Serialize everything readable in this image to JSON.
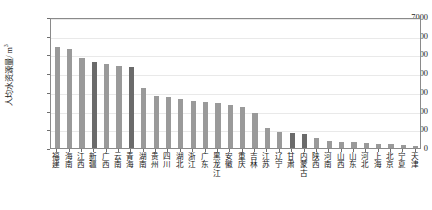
{
  "chart_data": {
    "type": "bar",
    "title": "",
    "subtitle": "",
    "xlabel": "",
    "ylabel": "人均水资源量/ m³",
    "ylabel_text": "人均水资源量/ m",
    "ylabel_exponent": "3",
    "ylim": [
      0,
      7000
    ],
    "ytick_values": [
      0,
      1000,
      2000,
      3000,
      4000,
      5000,
      6000,
      7000
    ],
    "ytick_labels": [
      "0",
      "1000",
      "2000",
      "3000",
      "4000",
      "5000",
      "6000",
      "7000"
    ],
    "grid": true,
    "grid_axis": "y",
    "legend": null,
    "legend_position": "none",
    "bar_color": "#9a9a9a",
    "bar_color_highlight": "#6b6b6b",
    "frame_color": "#8a8a8a",
    "gridline_color": "#e9e9e9",
    "categories": [
      "福建",
      "海南",
      "江西",
      "新疆",
      "广西",
      "云南",
      "青海",
      "湖南",
      "贵州",
      "四川",
      "湖北",
      "浙江",
      "广东",
      "黑龙江",
      "安徽",
      "重庆",
      "吉林",
      "江苏",
      "辽宁",
      "甘肃",
      "内蒙古",
      "陕西",
      "河南",
      "山西",
      "山东",
      "河北",
      "上海",
      "北京",
      "宁夏",
      "天津"
    ],
    "values": [
      5400,
      5310,
      4810,
      4580,
      4480,
      4360,
      4320,
      3200,
      2800,
      2710,
      2640,
      2510,
      2480,
      2390,
      2290,
      2210,
      1880,
      1060,
      880,
      800,
      740,
      510,
      380,
      340,
      300,
      260,
      230,
      200,
      150,
      100
    ],
    "highlighted_categories": [
      "新疆",
      "青海",
      "甘肃",
      "内蒙古"
    ]
  },
  "figure": {
    "background_color": "#ffffff"
  }
}
